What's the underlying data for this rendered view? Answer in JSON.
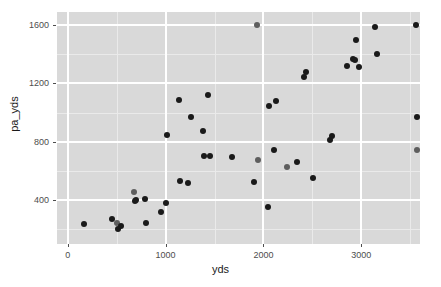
{
  "chart_data": {
    "type": "scatter",
    "title": "",
    "xlabel": "yds",
    "ylabel": "pa_yds",
    "xlim": [
      -110,
      3600
    ],
    "ylim": [
      100,
      1690
    ],
    "xticks": [
      0,
      1000,
      2000,
      3000
    ],
    "yticks": [
      400,
      800,
      1200,
      1600
    ],
    "x_minor_ticks": [
      500,
      1500,
      2500,
      3500
    ],
    "y_minor_ticks": [
      200,
      600,
      1000,
      1400
    ],
    "grid": true,
    "legend": null,
    "panel_background": "#d9d9d9",
    "grid_color": "#ffffff",
    "point_color": "#1a1a1a",
    "points": [
      {
        "x": 170,
        "y": 237,
        "shade": "dark"
      },
      {
        "x": 455,
        "y": 268,
        "shade": "dark"
      },
      {
        "x": 500,
        "y": 243,
        "shade": "light"
      },
      {
        "x": 512,
        "y": 200,
        "shade": "dark"
      },
      {
        "x": 545,
        "y": 222,
        "shade": "dark"
      },
      {
        "x": 680,
        "y": 458,
        "shade": "light"
      },
      {
        "x": 683,
        "y": 396,
        "shade": "dark"
      },
      {
        "x": 693,
        "y": 404,
        "shade": "dark"
      },
      {
        "x": 790,
        "y": 411,
        "shade": "dark"
      },
      {
        "x": 800,
        "y": 245,
        "shade": "dark"
      },
      {
        "x": 950,
        "y": 316,
        "shade": "dark"
      },
      {
        "x": 1000,
        "y": 380,
        "shade": "dark"
      },
      {
        "x": 1010,
        "y": 850,
        "shade": "dark"
      },
      {
        "x": 1140,
        "y": 1085,
        "shade": "dark"
      },
      {
        "x": 1150,
        "y": 530,
        "shade": "dark"
      },
      {
        "x": 1225,
        "y": 520,
        "shade": "dark"
      },
      {
        "x": 1255,
        "y": 970,
        "shade": "dark"
      },
      {
        "x": 1380,
        "y": 875,
        "shade": "dark"
      },
      {
        "x": 1390,
        "y": 705,
        "shade": "dark"
      },
      {
        "x": 1430,
        "y": 1120,
        "shade": "dark"
      },
      {
        "x": 1450,
        "y": 705,
        "shade": "dark"
      },
      {
        "x": 1680,
        "y": 695,
        "shade": "dark"
      },
      {
        "x": 1905,
        "y": 525,
        "shade": "dark"
      },
      {
        "x": 1935,
        "y": 1600,
        "shade": "light"
      },
      {
        "x": 1940,
        "y": 675,
        "shade": "light"
      },
      {
        "x": 2045,
        "y": 355,
        "shade": "dark"
      },
      {
        "x": 2060,
        "y": 1045,
        "shade": "dark"
      },
      {
        "x": 2105,
        "y": 745,
        "shade": "dark"
      },
      {
        "x": 2125,
        "y": 1080,
        "shade": "dark"
      },
      {
        "x": 2240,
        "y": 625,
        "shade": "light"
      },
      {
        "x": 2345,
        "y": 665,
        "shade": "dark"
      },
      {
        "x": 2415,
        "y": 1245,
        "shade": "dark"
      },
      {
        "x": 2430,
        "y": 1280,
        "shade": "dark"
      },
      {
        "x": 2510,
        "y": 555,
        "shade": "dark"
      },
      {
        "x": 2680,
        "y": 815,
        "shade": "dark"
      },
      {
        "x": 2700,
        "y": 840,
        "shade": "dark"
      },
      {
        "x": 2855,
        "y": 1320,
        "shade": "dark"
      },
      {
        "x": 2920,
        "y": 1370,
        "shade": "dark"
      },
      {
        "x": 2935,
        "y": 1360,
        "shade": "dark"
      },
      {
        "x": 2950,
        "y": 1500,
        "shade": "dark"
      },
      {
        "x": 2975,
        "y": 1315,
        "shade": "dark"
      },
      {
        "x": 3140,
        "y": 1590,
        "shade": "dark"
      },
      {
        "x": 3160,
        "y": 1400,
        "shade": "dark"
      },
      {
        "x": 3555,
        "y": 1600,
        "shade": "dark"
      },
      {
        "x": 3570,
        "y": 970,
        "shade": "dark"
      },
      {
        "x": 3570,
        "y": 745,
        "shade": "light"
      }
    ]
  },
  "axes": {
    "x_tick_labels": [
      "0",
      "1000",
      "2000",
      "3000"
    ],
    "y_tick_labels": [
      "400",
      "800",
      "1200",
      "1600"
    ],
    "x_axis_title": "yds",
    "y_axis_title": "pa_yds"
  }
}
